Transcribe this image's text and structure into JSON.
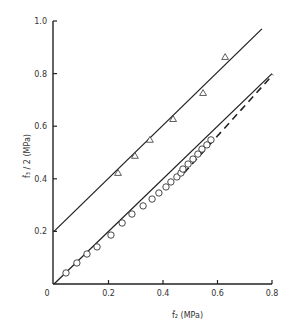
{
  "chart_data": {
    "type": "scatter",
    "title": "",
    "xlabel": "f̂₂ (MPa)",
    "ylabel": "f̂₃ / 2 (MPa)",
    "xlim": [
      0,
      0.8
    ],
    "ylim": [
      0,
      1.0
    ],
    "grid": false,
    "legend": "none",
    "x_ticks": [
      "0",
      "0.2",
      "0.4",
      "0.6",
      "0.8"
    ],
    "y_ticks": [
      "0.2",
      "0.4",
      "0.6",
      "0.8",
      "1.0"
    ],
    "origin_label": "0",
    "series": [
      {
        "name": "triangles",
        "marker": "triangle-open",
        "points": [
          [
            0.235,
            0.422
          ],
          [
            0.297,
            0.487
          ],
          [
            0.352,
            0.548
          ],
          [
            0.437,
            0.627
          ],
          [
            0.547,
            0.726
          ],
          [
            0.628,
            0.863
          ]
        ]
      },
      {
        "name": "circles",
        "marker": "circle-open",
        "points": [
          [
            0.044,
            0.042
          ],
          [
            0.084,
            0.08
          ],
          [
            0.121,
            0.114
          ],
          [
            0.158,
            0.141
          ],
          [
            0.209,
            0.186
          ],
          [
            0.25,
            0.232
          ],
          [
            0.286,
            0.266
          ],
          [
            0.327,
            0.297
          ],
          [
            0.36,
            0.323
          ],
          [
            0.385,
            0.346
          ],
          [
            0.411,
            0.369
          ],
          [
            0.429,
            0.388
          ],
          [
            0.451,
            0.407
          ],
          [
            0.466,
            0.422
          ],
          [
            0.473,
            0.437
          ],
          [
            0.492,
            0.456
          ],
          [
            0.51,
            0.475
          ],
          [
            0.528,
            0.494
          ],
          [
            0.543,
            0.513
          ],
          [
            0.561,
            0.529
          ],
          [
            0.576,
            0.548
          ]
        ]
      }
    ],
    "lines": [
      {
        "name": "upper-fit-line",
        "style": "solid",
        "from": [
          0,
          0.2
        ],
        "to": [
          0.763,
          0.97
        ]
      },
      {
        "name": "lower-fit-line",
        "style": "solid",
        "from": [
          0,
          0
        ],
        "to": [
          0.8,
          0.8
        ]
      },
      {
        "name": "lower-dashed-line",
        "style": "dashed",
        "from": [
          0.47,
          0.43
        ],
        "to": [
          0.8,
          0.8
        ]
      }
    ]
  }
}
